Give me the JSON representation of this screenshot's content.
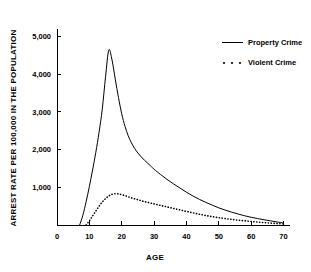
{
  "chart_data": {
    "type": "line",
    "title": "",
    "xlabel": "AGE",
    "ylabel": "ARREST RATE PER 100,000  IN THE POPULATION",
    "xlim": [
      0,
      72
    ],
    "ylim": [
      0,
      5200
    ],
    "grid": false,
    "legend_position": "top-right",
    "xticks": [
      0,
      10,
      20,
      30,
      40,
      50,
      60,
      70
    ],
    "xtick_labels": [
      "0",
      "10",
      "20",
      "30",
      "40",
      "50",
      "60",
      "70"
    ],
    "yticks": [
      1000,
      2000,
      3000,
      4000,
      5000
    ],
    "ytick_labels": [
      "1,000",
      "2,000",
      "3,000",
      "4,000",
      "5,000"
    ],
    "series": [
      {
        "name": "Property Crime",
        "style": "solid",
        "color": "#000000",
        "x": [
          7,
          8,
          9,
          10,
          11,
          12,
          13,
          14,
          15,
          16,
          17,
          18,
          19,
          20,
          21,
          22,
          23,
          24,
          25,
          26,
          27,
          28,
          29,
          30,
          32,
          34,
          36,
          38,
          40,
          42,
          44,
          46,
          48,
          50,
          52,
          54,
          56,
          58,
          60,
          62,
          64,
          66,
          68,
          70
        ],
        "y": [
          0,
          260,
          620,
          1020,
          1460,
          1930,
          2460,
          3080,
          3930,
          4640,
          4380,
          3870,
          3380,
          2950,
          2620,
          2370,
          2180,
          2030,
          1910,
          1810,
          1720,
          1640,
          1560,
          1480,
          1340,
          1210,
          1090,
          980,
          870,
          770,
          680,
          600,
          525,
          455,
          395,
          340,
          290,
          245,
          205,
          170,
          140,
          110,
          80,
          55
        ]
      },
      {
        "name": "Violent Crime",
        "style": "dotted",
        "color": "#000000",
        "x": [
          9,
          10,
          11,
          12,
          13,
          14,
          15,
          16,
          17,
          18,
          19,
          20,
          21,
          22,
          23,
          24,
          25,
          26,
          27,
          28,
          29,
          30,
          32,
          34,
          36,
          38,
          40,
          42,
          44,
          46,
          48,
          50,
          52,
          54,
          56,
          58,
          60,
          62,
          64,
          66,
          68,
          70
        ],
        "y": [
          0,
          110,
          240,
          370,
          500,
          610,
          700,
          770,
          815,
          830,
          825,
          805,
          780,
          750,
          720,
          695,
          670,
          645,
          620,
          600,
          580,
          560,
          520,
          480,
          440,
          400,
          360,
          322,
          286,
          252,
          222,
          194,
          170,
          148,
          128,
          110,
          94,
          78,
          64,
          50,
          38,
          28
        ]
      }
    ],
    "annotations": {
      "property_peak_age": 16,
      "property_peak_value": 4640,
      "violent_peak_age": 19,
      "violent_peak_value": 830
    }
  },
  "legend": {
    "entries": [
      {
        "label": "Property Crime",
        "marker": "solid-line-sample"
      },
      {
        "label": "Violent Crime",
        "marker": "dotted-line-sample"
      }
    ]
  }
}
